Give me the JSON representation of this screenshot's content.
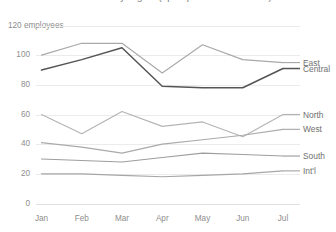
{
  "chart_data": {
    "type": "line",
    "title": "Headcount by region (open positions excluded)",
    "xlabel": "",
    "ylabel": "employees",
    "ylim": [
      0,
      120
    ],
    "yticks": [
      0,
      20,
      40,
      60,
      80,
      100,
      120
    ],
    "ytick_labels": [
      "0",
      "20",
      "40",
      "60",
      "80",
      "100",
      "120 employees"
    ],
    "grid": true,
    "legend_position": "right-direct-labels",
    "categories": [
      "Jan",
      "Feb",
      "Mar",
      "Apr",
      "May",
      "Jun",
      "Jul"
    ],
    "series": [
      {
        "name": "East",
        "color": "#a9a9a9",
        "values": [
          100,
          108,
          108,
          88,
          107,
          97,
          95
        ]
      },
      {
        "name": "Central",
        "color": "#555555",
        "values": [
          90,
          97,
          105,
          79,
          78,
          78,
          91
        ]
      },
      {
        "name": "North",
        "color": "#b4b4b4",
        "values": [
          60,
          47,
          62,
          52,
          55,
          45,
          60
        ]
      },
      {
        "name": "West",
        "color": "#aaaaaa",
        "values": [
          41,
          38,
          34,
          40,
          43,
          46,
          50
        ]
      },
      {
        "name": "South",
        "color": "#9e9e9e",
        "values": [
          30,
          29,
          28,
          31,
          34,
          33,
          32
        ]
      },
      {
        "name": "Int'l",
        "color": "#a6a6a6",
        "values": [
          20,
          20,
          19,
          18,
          19,
          20,
          22
        ]
      }
    ]
  },
  "axis": {
    "y_top_label": "120 employees"
  }
}
